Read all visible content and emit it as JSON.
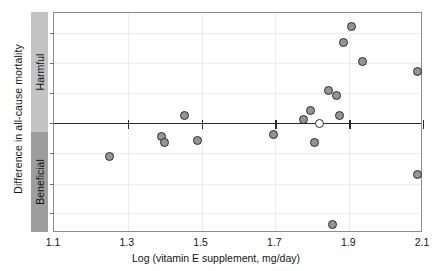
{
  "figure": {
    "y_axis_title": "Difference in all-cause mortality",
    "direction_bands": [
      {
        "name": "harmful",
        "label": "Harmful",
        "color": "#c3c3c3"
      },
      {
        "name": "beneficial",
        "label": "Beneficial",
        "color": "#9d9d9d"
      }
    ]
  },
  "chart_data": {
    "type": "scatter",
    "title": "",
    "xlabel": "Log (vitamin E supplement, mg/day)",
    "ylabel": "Difference in all-cause mortality",
    "xlim": [
      1.1,
      2.1
    ],
    "ylim": [
      -1.0,
      1.0
    ],
    "xticks": [
      1.1,
      1.3,
      1.5,
      1.7,
      1.9,
      2.1
    ],
    "xtick_labels": [
      "1.1",
      "1.3",
      "1.5",
      "1.7",
      "1.9",
      "2.1"
    ],
    "yticks": [
      -0.82,
      -0.55,
      -0.27,
      0.0,
      0.27,
      0.55,
      0.82
    ],
    "ytick_labels": [
      "",
      "",
      "",
      "",
      "",
      "",
      ""
    ],
    "grid": true,
    "legend": null,
    "reference_line": {
      "y": 0.0,
      "style": "solid",
      "color": "#2b2b2b",
      "label": "no difference"
    },
    "series": [
      {
        "name": "Trials",
        "marker": "filled-circle",
        "color": "#949494",
        "edge_color": "#2c2c2c",
        "points": [
          {
            "x": 1.25,
            "y": -0.3
          },
          {
            "x": 1.39,
            "y": -0.12
          },
          {
            "x": 1.4,
            "y": -0.18
          },
          {
            "x": 1.455,
            "y": 0.07
          },
          {
            "x": 1.49,
            "y": -0.16
          },
          {
            "x": 1.695,
            "y": -0.1
          },
          {
            "x": 1.775,
            "y": 0.03
          },
          {
            "x": 1.795,
            "y": 0.11
          },
          {
            "x": 1.805,
            "y": -0.18
          },
          {
            "x": 1.845,
            "y": 0.3
          },
          {
            "x": 1.855,
            "y": -0.92
          },
          {
            "x": 1.865,
            "y": 0.25
          },
          {
            "x": 1.875,
            "y": 0.065
          },
          {
            "x": 1.885,
            "y": 0.73
          },
          {
            "x": 1.905,
            "y": 0.88
          },
          {
            "x": 1.935,
            "y": 0.56
          },
          {
            "x": 2.085,
            "y": 0.47
          },
          {
            "x": 2.085,
            "y": -0.47
          }
        ]
      },
      {
        "name": "Pooled estimate",
        "marker": "open-circle",
        "color": "#ffffff",
        "edge_color": "#2c2c2c",
        "points": [
          {
            "x": 1.82,
            "y": 0.0
          }
        ]
      }
    ]
  }
}
